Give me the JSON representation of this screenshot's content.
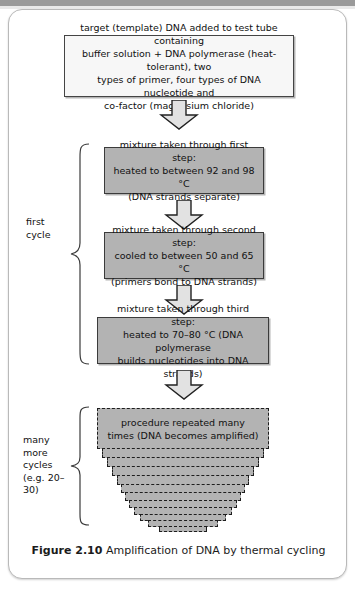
{
  "figure": {
    "caption_number": "Figure 2.10",
    "caption_text": "Amplification of DNA by thermal cycling"
  },
  "colors": {
    "box_gray_fill": "#b3b3b3",
    "box_white_fill": "#f7f7f7",
    "box_border": "#3b3b3b",
    "arrow_fill": "#e2e2e2",
    "arrow_border": "#222222",
    "panel_border": "#b9b9b9",
    "text": "#111111"
  },
  "flow": {
    "intro_box": {
      "line1": "target (template) DNA added to test tube containing",
      "line2": "buffer solution + DNA polymerase (heat-tolerant), two",
      "line3": "types of primer, four types of DNA nucleotide and",
      "line4": "co-factor (magnesium chloride)"
    },
    "step1": {
      "line1": "mixture taken through first step:",
      "line2": "heated to between 92 and 98 °C",
      "line3": "(DNA strands separate)"
    },
    "step2": {
      "line1": "mixture taken through second step:",
      "line2": "cooled to between 50 and 65 °C",
      "line3": "(primers bond to DNA strands)"
    },
    "step3": {
      "line1": "mixture taken through third step:",
      "line2": "heated to 70–80 °C (DNA polymerase",
      "line3": "builds nucleotides into DNA strands)"
    },
    "repeat_box": {
      "line1": "procedure repeated many",
      "line2": "times (DNA becomes amplified)"
    }
  },
  "labels": {
    "first_cycle_line1": "first",
    "first_cycle_line2": "cycle",
    "many_cycles_line1": "many more",
    "many_cycles_line2": "cycles",
    "many_cycles_line3": "(e.g. 20–30)"
  }
}
